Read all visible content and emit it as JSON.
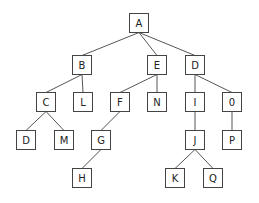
{
  "diagram": {
    "type": "tree",
    "box_size": 19,
    "colors": {
      "edge": "#555555",
      "box_border": "#444444",
      "box_fill": "#ffffff",
      "text": "#222222",
      "background": "#ffffff"
    },
    "nodes": [
      {
        "id": "A",
        "label": "A",
        "x": 129,
        "y": 13
      },
      {
        "id": "B",
        "label": "B",
        "x": 72,
        "y": 55
      },
      {
        "id": "E",
        "label": "E",
        "x": 147,
        "y": 55
      },
      {
        "id": "D1",
        "label": "D",
        "x": 185,
        "y": 55
      },
      {
        "id": "C",
        "label": "C",
        "x": 36,
        "y": 92
      },
      {
        "id": "L",
        "label": "L",
        "x": 73,
        "y": 92
      },
      {
        "id": "F",
        "label": "F",
        "x": 110,
        "y": 92
      },
      {
        "id": "N",
        "label": "N",
        "x": 147,
        "y": 92
      },
      {
        "id": "I",
        "label": "I",
        "x": 185,
        "y": 92
      },
      {
        "id": "O",
        "label": "0",
        "x": 222,
        "y": 92
      },
      {
        "id": "D2",
        "label": "D",
        "x": 16,
        "y": 130
      },
      {
        "id": "M",
        "label": "M",
        "x": 54,
        "y": 130
      },
      {
        "id": "G",
        "label": "G",
        "x": 91,
        "y": 130
      },
      {
        "id": "J",
        "label": "J",
        "x": 185,
        "y": 130
      },
      {
        "id": "P",
        "label": "P",
        "x": 222,
        "y": 130
      },
      {
        "id": "H",
        "label": "H",
        "x": 72,
        "y": 168
      },
      {
        "id": "K",
        "label": "K",
        "x": 165,
        "y": 168
      },
      {
        "id": "Q",
        "label": "Q",
        "x": 203,
        "y": 168
      }
    ],
    "edges": [
      {
        "from": "A",
        "to": "B"
      },
      {
        "from": "A",
        "to": "E"
      },
      {
        "from": "A",
        "to": "D1"
      },
      {
        "from": "B",
        "to": "C"
      },
      {
        "from": "B",
        "to": "L"
      },
      {
        "from": "E",
        "to": "F"
      },
      {
        "from": "E",
        "to": "N"
      },
      {
        "from": "D1",
        "to": "I"
      },
      {
        "from": "D1",
        "to": "O"
      },
      {
        "from": "C",
        "to": "D2"
      },
      {
        "from": "C",
        "to": "M"
      },
      {
        "from": "F",
        "to": "G"
      },
      {
        "from": "G",
        "to": "H"
      },
      {
        "from": "I",
        "to": "J"
      },
      {
        "from": "O",
        "to": "P"
      },
      {
        "from": "J",
        "to": "K"
      },
      {
        "from": "J",
        "to": "Q"
      }
    ]
  }
}
